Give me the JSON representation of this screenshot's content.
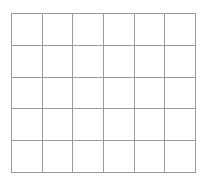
{
  "grid": {
    "rows": 5,
    "columns": 6,
    "line_color": "#9a9a9a",
    "background": "#ffffff"
  }
}
